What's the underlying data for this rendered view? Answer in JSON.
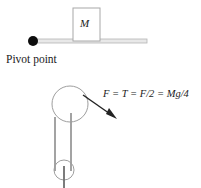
{
  "figure": {
    "width": 201,
    "height": 188,
    "background_color": "#ffffff",
    "line_color": "#808080",
    "ink_color": "#1a1a1a"
  },
  "top_diagram": {
    "name": "lever-with-mass",
    "mass_block": {
      "label": "M",
      "x": 73,
      "y": 8,
      "width": 27,
      "height": 33,
      "stroke": "#a0a0a0"
    },
    "rod": {
      "x1": 33,
      "y1": 41,
      "x2": 147,
      "y2": 41,
      "thickness": 4,
      "stroke": "#b0b0b0"
    },
    "pivot": {
      "label": "Pivot point",
      "cx": 33,
      "cy": 41,
      "r": 5,
      "fill": "#000000"
    }
  },
  "bottom_diagram": {
    "name": "pulley-system",
    "upper_pulley": {
      "cx": 70,
      "cy": 104,
      "r": 18,
      "stroke": "#9a9a9a"
    },
    "lower_pulley": {
      "cx": 64,
      "cy": 170,
      "r": 10,
      "stroke": "#9a9a9a"
    },
    "ropes": [
      {
        "x1": 55,
        "y1": 118,
        "x2": 55,
        "y2": 170
      },
      {
        "x1": 71,
        "y1": 113,
        "x2": 71,
        "y2": 170
      },
      {
        "x1": 64,
        "y1": 166,
        "x2": 64,
        "y2": 188
      }
    ],
    "force_arrow": {
      "x1": 83,
      "y1": 95,
      "x2": 116,
      "y2": 118,
      "stroke": "#222222"
    },
    "force_equation": "F = T = F/2 = Mg/4"
  }
}
